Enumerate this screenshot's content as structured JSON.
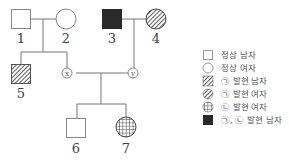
{
  "pedigree": {
    "individuals": [
      {
        "id": "1",
        "label": "1",
        "sex": "male",
        "phenotype": "normal"
      },
      {
        "id": "2",
        "label": "2",
        "sex": "female",
        "phenotype": "normal"
      },
      {
        "id": "3",
        "label": "3",
        "sex": "male",
        "phenotype": "trait-a-and-b"
      },
      {
        "id": "4",
        "label": "4",
        "sex": "female",
        "phenotype": "trait-a"
      },
      {
        "id": "5",
        "label": "5",
        "sex": "male",
        "phenotype": "trait-a"
      },
      {
        "id": "x",
        "label": "x",
        "sex": "unknown",
        "phenotype": "unknown"
      },
      {
        "id": "y",
        "label": "y",
        "sex": "unknown",
        "phenotype": "unknown"
      },
      {
        "id": "6",
        "label": "6",
        "sex": "male",
        "phenotype": "normal"
      },
      {
        "id": "7",
        "label": "7",
        "sex": "female",
        "phenotype": "trait-b"
      }
    ],
    "couples": [
      [
        "1",
        "2"
      ],
      [
        "3",
        "4"
      ],
      [
        "x",
        "y"
      ]
    ],
    "children": {
      "1-2": [
        "5",
        "x"
      ],
      "3-4": [
        "y"
      ],
      "x-y": [
        "6",
        "7"
      ]
    }
  },
  "legend": {
    "items": [
      {
        "symbol": "square-empty",
        "label": "정상 남자"
      },
      {
        "symbol": "circle-empty",
        "label": "정상 여자"
      },
      {
        "symbol": "square-hatched",
        "label": "㉠ 발현 남자"
      },
      {
        "symbol": "circle-hatched",
        "label": "㉠ 발현 여자"
      },
      {
        "symbol": "circle-grid",
        "label": "㉡ 발현 여자"
      },
      {
        "symbol": "square-filled",
        "label": "㉠, ㉡ 발현 남자"
      }
    ]
  },
  "colors": {
    "line": "#777777",
    "fill_dark": "#2a2a2a",
    "hatch": "#444444"
  }
}
